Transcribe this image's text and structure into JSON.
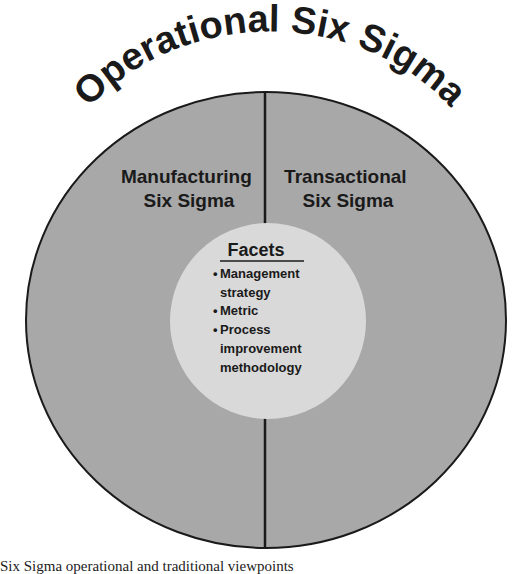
{
  "diagram": {
    "title": "Operational Six Sigma",
    "outer_circle": {
      "fill": "#a8a8a8",
      "stroke": "#1a1a1a",
      "left_half_label": [
        "Manufacturing",
        "Six Sigma"
      ],
      "right_half_label": [
        "Transactional",
        "Six Sigma"
      ]
    },
    "inner_circle": {
      "fill": "#d9d9d9",
      "heading": "Facets",
      "items": [
        {
          "bullet": "•",
          "lines": [
            "Management",
            "strategy"
          ]
        },
        {
          "bullet": "•",
          "lines": [
            "Metric"
          ]
        },
        {
          "bullet": "•",
          "lines": [
            "Process",
            "improvement",
            "methodology"
          ]
        }
      ]
    }
  },
  "caption": "Six Sigma operational and traditional viewpoints"
}
